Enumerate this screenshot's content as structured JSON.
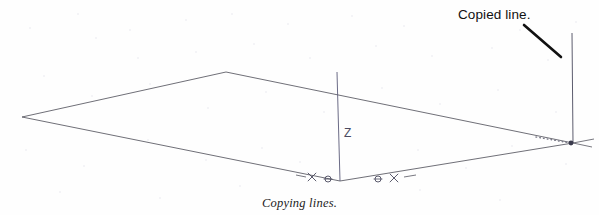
{
  "figure": {
    "caption": "Copying lines.",
    "callout": {
      "text": "Copied line.",
      "leader_from": [
        524,
        25
      ],
      "leader_to": [
        561,
        57
      ]
    },
    "axis": {
      "label": "Z",
      "color": "#5a5a78",
      "top": [
        337,
        72
      ],
      "bottom": [
        340,
        181
      ]
    },
    "ground_plane": {
      "stroke": "#55555f",
      "vertices": [
        [
          22,
          117
        ],
        [
          226,
          72
        ],
        [
          573,
          143
        ],
        [
          340,
          181
        ]
      ]
    },
    "copied_line": {
      "color": "#4a4a5e",
      "top": [
        572,
        33
      ],
      "bottom": [
        573,
        143
      ]
    },
    "inference_line": {
      "style": "dotted",
      "color": "#7a7a88",
      "from": [
        536,
        137
      ],
      "to": [
        570,
        143
      ]
    },
    "markers": [
      {
        "name": "endpoint-cross-left",
        "glyph": "x",
        "x": 312,
        "y": 177
      },
      {
        "name": "midpoint-circle-left",
        "glyph": "circle",
        "x": 328,
        "y": 179
      },
      {
        "name": "midpoint-circle-right",
        "glyph": "circle",
        "x": 378,
        "y": 179
      },
      {
        "name": "endpoint-cross-right",
        "glyph": "x",
        "x": 394,
        "y": 178
      },
      {
        "name": "endpoint-node-right",
        "glyph": "node",
        "x": 571,
        "y": 143
      }
    ],
    "background": {
      "color": "#fefefe",
      "speckle_color": "#e8e8ee",
      "speckles": [
        [
          30,
          28
        ],
        [
          78,
          14
        ],
        [
          96,
          38
        ],
        [
          130,
          30
        ],
        [
          138,
          58
        ],
        [
          186,
          20
        ],
        [
          196,
          52
        ],
        [
          232,
          14
        ],
        [
          254,
          44
        ],
        [
          288,
          24
        ],
        [
          310,
          58
        ],
        [
          352,
          16
        ],
        [
          376,
          46
        ],
        [
          404,
          26
        ],
        [
          432,
          56
        ],
        [
          460,
          18
        ],
        [
          492,
          48
        ],
        [
          520,
          30
        ],
        [
          548,
          60
        ],
        [
          576,
          22
        ],
        [
          44,
          76
        ],
        [
          92,
          96
        ],
        [
          150,
          84
        ],
        [
          208,
          108
        ],
        [
          266,
          92
        ],
        [
          324,
          112
        ],
        [
          382,
          88
        ],
        [
          440,
          104
        ],
        [
          498,
          90
        ],
        [
          556,
          112
        ],
        [
          26,
          150
        ],
        [
          84,
          166
        ],
        [
          148,
          140
        ],
        [
          206,
          160
        ],
        [
          262,
          148
        ],
        [
          300,
          162
        ],
        [
          418,
          150
        ],
        [
          466,
          168
        ],
        [
          512,
          146
        ],
        [
          566,
          164
        ],
        [
          60,
          192
        ],
        [
          160,
          198
        ],
        [
          240,
          186
        ],
        [
          420,
          190
        ],
        [
          500,
          200
        ]
      ]
    }
  }
}
